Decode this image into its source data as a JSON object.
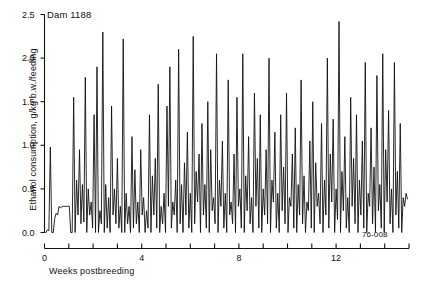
{
  "figure": {
    "dam_label": "Dam 1188",
    "code_label": "76-008"
  },
  "chart_data": {
    "type": "line",
    "title": "Dam 1188",
    "xlabel": "Weeks postbreeding",
    "ylabel": "Ethanol consumption, g/kg b.w./feeding",
    "xlim": [
      0,
      15
    ],
    "ylim": [
      0.0,
      2.5
    ],
    "grid": false,
    "legend": null,
    "annotations": [
      "Dam 1188",
      "76-008"
    ],
    "yticks": [
      0.0,
      0.5,
      1.0,
      1.5,
      2.0,
      2.5
    ],
    "ytick_labels": [
      "0.0",
      "0.5",
      "1.0",
      "1.5",
      "2.0",
      "2.5"
    ],
    "xticks": [
      0,
      1,
      2,
      3,
      4,
      5,
      6,
      7,
      8,
      9,
      10,
      11,
      12,
      13,
      14,
      15
    ],
    "xtick_labels": [
      "0",
      "",
      "",
      "",
      "4",
      "",
      "",
      "",
      "8",
      "",
      "",
      "",
      "12",
      "",
      "",
      ""
    ],
    "series_name": "Ethanol consumption per feeding",
    "x": [
      0.0,
      0.06,
      0.12,
      0.18,
      0.24,
      0.3,
      0.36,
      0.42,
      0.48,
      0.54,
      0.6,
      0.66,
      0.72,
      0.78,
      0.84,
      0.9,
      0.96,
      1.02,
      1.08,
      1.14,
      1.2,
      1.26,
      1.32,
      1.38,
      1.44,
      1.5,
      1.56,
      1.62,
      1.68,
      1.74,
      1.8,
      1.86,
      1.92,
      1.98,
      2.04,
      2.1,
      2.16,
      2.22,
      2.28,
      2.34,
      2.4,
      2.46,
      2.52,
      2.58,
      2.64,
      2.7,
      2.76,
      2.82,
      2.88,
      2.94,
      3.0,
      3.06,
      3.12,
      3.18,
      3.24,
      3.3,
      3.36,
      3.42,
      3.48,
      3.54,
      3.6,
      3.66,
      3.72,
      3.78,
      3.84,
      3.9,
      3.96,
      4.02,
      4.08,
      4.14,
      4.2,
      4.26,
      4.32,
      4.38,
      4.44,
      4.5,
      4.56,
      4.62,
      4.68,
      4.74,
      4.8,
      4.86,
      4.92,
      4.98,
      5.04,
      5.1,
      5.16,
      5.22,
      5.28,
      5.34,
      5.4,
      5.46,
      5.52,
      5.58,
      5.64,
      5.7,
      5.76,
      5.82,
      5.88,
      5.94,
      6.0,
      6.06,
      6.12,
      6.18,
      6.24,
      6.3,
      6.36,
      6.42,
      6.48,
      6.54,
      6.6,
      6.66,
      6.72,
      6.78,
      6.84,
      6.9,
      6.96,
      7.02,
      7.08,
      7.14,
      7.2,
      7.26,
      7.32,
      7.38,
      7.44,
      7.5,
      7.56,
      7.62,
      7.68,
      7.74,
      7.8,
      7.86,
      7.92,
      7.98,
      8.04,
      8.1,
      8.16,
      8.22,
      8.28,
      8.34,
      8.4,
      8.46,
      8.52,
      8.58,
      8.64,
      8.7,
      8.76,
      8.82,
      8.88,
      8.94,
      9.0,
      9.06,
      9.12,
      9.18,
      9.24,
      9.3,
      9.36,
      9.42,
      9.48,
      9.54,
      9.6,
      9.66,
      9.72,
      9.78,
      9.84,
      9.9,
      9.96,
      10.02,
      10.08,
      10.14,
      10.2,
      10.26,
      10.32,
      10.38,
      10.44,
      10.5,
      10.56,
      10.62,
      10.68,
      10.74,
      10.8,
      10.86,
      10.92,
      10.98,
      11.04,
      11.1,
      11.16,
      11.22,
      11.28,
      11.34,
      11.4,
      11.46,
      11.52,
      11.58,
      11.64,
      11.7,
      11.76,
      11.82,
      11.88,
      11.94,
      12.0,
      12.06,
      12.12,
      12.18,
      12.24,
      12.3,
      12.36,
      12.42,
      12.48,
      12.54,
      12.6,
      12.66,
      12.72,
      12.78,
      12.84,
      12.9,
      12.96,
      13.02,
      13.08,
      13.14,
      13.2,
      13.26,
      13.32,
      13.38,
      13.44,
      13.5,
      13.56,
      13.62,
      13.68,
      13.74,
      13.8,
      13.86,
      13.92,
      13.98,
      14.04,
      14.1,
      14.16,
      14.22,
      14.28,
      14.34,
      14.4,
      14.46,
      14.52,
      14.58,
      14.64,
      14.7,
      14.76,
      14.82,
      14.88,
      14.94
    ],
    "y": [
      0.0,
      0.0,
      0.03,
      0.02,
      0.98,
      0.0,
      0.0,
      0.16,
      0.22,
      0.2,
      0.3,
      0.28,
      0.3,
      0.3,
      0.3,
      0.3,
      0.3,
      0.3,
      0.0,
      0.0,
      1.55,
      0.0,
      0.6,
      0.2,
      0.95,
      0.1,
      0.55,
      0.12,
      1.78,
      0.0,
      0.5,
      0.2,
      0.35,
      0.05,
      1.35,
      0.0,
      1.9,
      0.0,
      0.25,
      0.1,
      2.3,
      0.0,
      0.55,
      0.05,
      0.4,
      0.0,
      1.45,
      0.2,
      0.5,
      0.1,
      0.85,
      0.05,
      0.3,
      0.0,
      2.22,
      0.0,
      0.45,
      0.1,
      0.3,
      0.0,
      1.1,
      0.05,
      0.72,
      0.1,
      0.35,
      0.0,
      0.95,
      0.2,
      0.4,
      0.0,
      0.25,
      0.05,
      1.35,
      0.0,
      0.65,
      0.2,
      0.85,
      0.05,
      1.7,
      0.0,
      0.3,
      0.1,
      0.45,
      0.0,
      1.45,
      0.3,
      1.9,
      0.05,
      0.35,
      0.2,
      0.6,
      0.0,
      2.1,
      0.1,
      0.55,
      0.0,
      0.8,
      0.2,
      1.15,
      0.05,
      0.45,
      0.0,
      2.25,
      0.1,
      0.7,
      0.35,
      0.9,
      0.0,
      1.25,
      0.2,
      0.55,
      0.05,
      1.5,
      0.0,
      0.95,
      0.25,
      0.4,
      0.1,
      2.05,
      0.0,
      0.6,
      0.3,
      1.05,
      0.05,
      0.45,
      0.0,
      1.75,
      0.2,
      0.35,
      0.1,
      0.9,
      0.0,
      1.55,
      0.3,
      0.5,
      0.05,
      2.05,
      0.0,
      0.65,
      0.25,
      1.1,
      0.1,
      0.4,
      0.0,
      1.6,
      0.3,
      0.85,
      0.05,
      1.35,
      0.0,
      0.5,
      0.2,
      0.95,
      0.1,
      2.0,
      0.0,
      0.6,
      0.35,
      1.15,
      0.05,
      0.45,
      0.0,
      1.35,
      0.25,
      0.75,
      0.1,
      1.6,
      0.0,
      0.4,
      0.3,
      0.9,
      0.05,
      1.2,
      0.0,
      0.55,
      0.2,
      1.75,
      0.1,
      0.65,
      0.0,
      0.35,
      0.25,
      1.05,
      0.05,
      1.5,
      0.0,
      0.8,
      0.3,
      0.45,
      0.1,
      1.25,
      0.0,
      0.6,
      0.2,
      2.0,
      0.05,
      0.9,
      0.35,
      1.3,
      0.0,
      0.5,
      0.15,
      2.42,
      0.0,
      0.7,
      0.25,
      1.1,
      0.05,
      0.4,
      0.0,
      1.55,
      0.3,
      0.85,
      0.1,
      1.35,
      0.0,
      0.6,
      0.2,
      1.05,
      0.05,
      1.95,
      0.0,
      0.45,
      0.3,
      1.2,
      0.1,
      0.75,
      0.0,
      1.8,
      0.25,
      0.55,
      0.05,
      2.05,
      0.0,
      0.95,
      0.35,
      1.4,
      0.1,
      0.5,
      0.0,
      1.95,
      0.2,
      0.7,
      0.05,
      1.25,
      0.0,
      0.4,
      0.3,
      0.45,
      0.38
    ]
  }
}
